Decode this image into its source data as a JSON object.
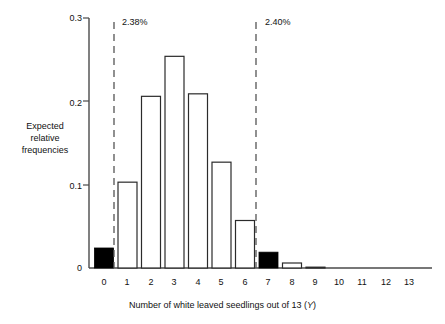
{
  "chart_data": {
    "type": "bar",
    "title": "",
    "xlabel": "Number of white leaved seedlings out of 13 (Y)",
    "xlabel_text": "Number of white leaved seedlings out of 13 (",
    "xlabel_var": "Y",
    "xlabel_tail": ")",
    "ylabel": "Expected relative frequencies",
    "ylabel_lines": [
      "Expected",
      "relative",
      "frequencies"
    ],
    "categories": [
      "0",
      "1",
      "2",
      "3",
      "4",
      "5",
      "6",
      "7",
      "8",
      "9",
      "10",
      "11",
      "12",
      "13"
    ],
    "values": [
      0.024,
      0.103,
      0.206,
      0.254,
      0.209,
      0.127,
      0.057,
      0.019,
      0.006,
      0.001,
      0.0,
      0.0,
      0.0,
      0.0
    ],
    "bar_fill_flags": [
      true,
      false,
      false,
      false,
      false,
      false,
      false,
      true,
      false,
      false,
      false,
      false,
      false,
      false
    ],
    "ylim": [
      0,
      0.3
    ],
    "xlim": [
      -0.5,
      13.5
    ],
    "yticks": [
      0,
      0.1,
      0.2,
      0.3
    ],
    "ytick_labels": [
      "0",
      "0.1",
      "0.2",
      "0.3"
    ],
    "grid": false,
    "legend": "none",
    "annotations": [
      {
        "name": "left-tail",
        "label": "2.38%",
        "x_position": 0.5
      },
      {
        "name": "right-tail",
        "label": "2.40%",
        "x_position": 6.5
      }
    ],
    "colors": {
      "bar_outline": "#2b2b2b",
      "bar_fill_highlight": "#000000",
      "bar_fill_normal": "#ffffff",
      "axis": "#4a4a4a",
      "dashed_line": "#555555",
      "text": "#111111"
    }
  }
}
